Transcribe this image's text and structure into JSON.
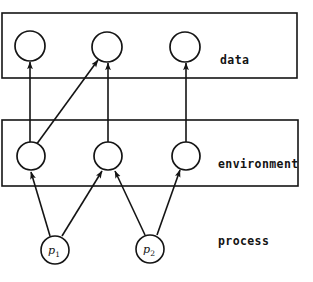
{
  "diagram": {
    "background_color": "#ffffff",
    "stroke_color": "#141414",
    "width": 313,
    "height": 282,
    "bands": [
      {
        "id": "data",
        "label": "data",
        "label_x": 220,
        "label_y": 64,
        "rect": {
          "x": 2,
          "y": 13,
          "w": 295,
          "h": 65
        }
      },
      {
        "id": "environment",
        "label": "environment",
        "label_x": 218,
        "label_y": 168,
        "rect": {
          "x": 2,
          "y": 120,
          "w": 296,
          "h": 66
        }
      },
      {
        "id": "process",
        "label": "process",
        "label_x": 218,
        "label_y": 245,
        "rect": null
      }
    ],
    "data_nodes": [
      {
        "id": "d1",
        "cx": 30,
        "cy": 46,
        "r": 15,
        "label": ""
      },
      {
        "id": "d2",
        "cx": 107,
        "cy": 47,
        "r": 15,
        "label": ""
      },
      {
        "id": "d3",
        "cx": 185,
        "cy": 47,
        "r": 15,
        "label": ""
      }
    ],
    "environment_nodes": [
      {
        "id": "e1",
        "cx": 31,
        "cy": 156,
        "r": 14,
        "label": ""
      },
      {
        "id": "e2",
        "cx": 108,
        "cy": 156,
        "r": 14,
        "label": ""
      },
      {
        "id": "e3",
        "cx": 186,
        "cy": 156,
        "r": 14,
        "label": ""
      }
    ],
    "process_nodes": [
      {
        "id": "p1",
        "cx": 55,
        "cy": 250,
        "r": 14,
        "label": "p",
        "subscript": "1"
      },
      {
        "id": "p2",
        "cx": 150,
        "cy": 249,
        "r": 14,
        "label": "p",
        "subscript": "2"
      }
    ],
    "edges": [
      {
        "id": "e1-d1",
        "from": "e1",
        "to": "d1",
        "x1": 30,
        "y1": 142,
        "x2": 30,
        "y2": 62,
        "arrow": true
      },
      {
        "id": "e1-d2",
        "from": "e1",
        "to": "d2",
        "x1": 36,
        "y1": 145,
        "x2": 98,
        "y2": 60,
        "arrow": true
      },
      {
        "id": "e2-d2",
        "from": "e2",
        "to": "d2",
        "x1": 108,
        "y1": 142,
        "x2": 108,
        "y2": 63,
        "arrow": true
      },
      {
        "id": "e3-d3",
        "from": "e3",
        "to": "d3",
        "x1": 186,
        "y1": 142,
        "x2": 186,
        "y2": 63,
        "arrow": true
      },
      {
        "id": "p1-e1",
        "from": "p1",
        "to": "e1",
        "x1": 50,
        "y1": 236,
        "x2": 31,
        "y2": 172,
        "arrow": true
      },
      {
        "id": "p1-e2",
        "from": "p1",
        "to": "e2",
        "x1": 62,
        "y1": 236,
        "x2": 102,
        "y2": 171,
        "arrow": true
      },
      {
        "id": "p2-e2",
        "from": "p2",
        "to": "e2",
        "x1": 145,
        "y1": 235,
        "x2": 115,
        "y2": 171,
        "arrow": true
      },
      {
        "id": "p2-e3",
        "from": "p2",
        "to": "e3",
        "x1": 157,
        "y1": 235,
        "x2": 180,
        "y2": 170,
        "arrow": true
      }
    ]
  }
}
